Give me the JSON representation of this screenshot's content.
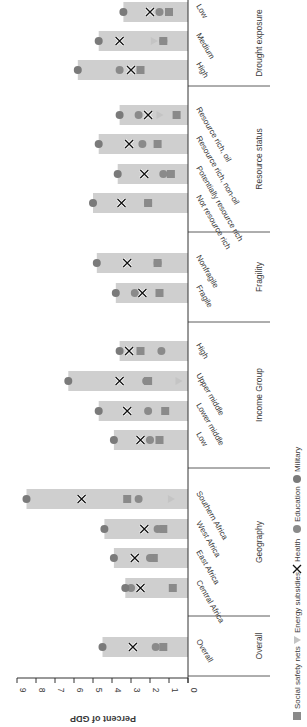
{
  "chart_data": {
    "type": "bar",
    "orientation": "rotated-90-clockwise (horizontal bars in screen space)",
    "title": "",
    "xlabel": "",
    "ylabel": "Percent of GDP",
    "ylim": [
      0,
      9
    ],
    "yticks": [
      0,
      1,
      2,
      3,
      4,
      5,
      6,
      7,
      8,
      9
    ],
    "grid": false,
    "legend_position": "bottom",
    "bar_series": "Military (bar length)",
    "legend": [
      {
        "name": "Social safety nets",
        "marker": "square",
        "color": "#8c8c8c"
      },
      {
        "name": "Energy subsidies",
        "marker": "triangle",
        "color": "#c8c8c8"
      },
      {
        "name": "Health",
        "marker": "x",
        "color": "#000000"
      },
      {
        "name": "Education",
        "marker": "circle",
        "color": "#8c8c8c"
      },
      {
        "name": "Military",
        "marker": "circle",
        "color": "#7a7a7a"
      }
    ],
    "groups": [
      {
        "name": "Overall",
        "categories": [
          {
            "label": "Overall",
            "military": 4.5,
            "health": 2.9,
            "education": 1.7,
            "social_safety_nets": 1.3,
            "energy_subsidies": null
          }
        ]
      },
      {
        "name": "Geography",
        "categories": [
          {
            "label": "Central Africa",
            "military": 3.3,
            "health": 2.5,
            "education": 3.0,
            "social_safety_nets": 0.8,
            "energy_subsidies": null
          },
          {
            "label": "East Africa",
            "military": 3.9,
            "health": 2.8,
            "education": 2.0,
            "social_safety_nets": 1.8,
            "energy_subsidies": null
          },
          {
            "label": "West Africa",
            "military": 4.4,
            "health": 2.3,
            "education": 1.6,
            "social_safety_nets": 1.3,
            "energy_subsidies": null
          },
          {
            "label": "Southern Africa",
            "military": 8.5,
            "health": 5.6,
            "education": 2.6,
            "social_safety_nets": 3.2,
            "energy_subsidies": 0.9
          }
        ]
      },
      {
        "name": "Income Group",
        "categories": [
          {
            "label": "Low",
            "military": 3.9,
            "health": 2.5,
            "education": 2.0,
            "social_safety_nets": 1.5,
            "energy_subsidies": null
          },
          {
            "label": "Lower middle",
            "military": 4.7,
            "health": 3.2,
            "education": 2.1,
            "social_safety_nets": 1.2,
            "energy_subsidies": null
          },
          {
            "label": "Upper middle",
            "military": 6.3,
            "health": 3.6,
            "education": 2.2,
            "social_safety_nets": 2.1,
            "energy_subsidies": 0.5
          },
          {
            "label": "High",
            "military": 3.6,
            "health": 3.1,
            "education": 1.4,
            "social_safety_nets": 2.5,
            "energy_subsidies": null
          }
        ]
      },
      {
        "name": "Fragility",
        "categories": [
          {
            "label": "Fragile",
            "military": 3.8,
            "health": 2.4,
            "education": 2.8,
            "social_safety_nets": 1.5,
            "energy_subsidies": null
          },
          {
            "label": "Nonfragile",
            "military": 4.8,
            "health": 3.2,
            "education": 1.6,
            "social_safety_nets": 1.6,
            "energy_subsidies": null
          }
        ]
      },
      {
        "name": "Resource status",
        "categories": [
          {
            "label": "Not resource rich",
            "military": 5.0,
            "health": 3.5,
            "education": 2.1,
            "social_safety_nets": 2.1,
            "energy_subsidies": null
          },
          {
            "label": "Potentially resource rich",
            "military": 3.7,
            "health": 2.3,
            "education": 1.3,
            "social_safety_nets": 0.9,
            "energy_subsidies": null
          },
          {
            "label": "Resource rich, non-oil",
            "military": 4.7,
            "health": 3.1,
            "education": 2.4,
            "social_safety_nets": 1.6,
            "energy_subsidies": null
          },
          {
            "label": "Resource rich, oil",
            "military": 3.6,
            "health": 2.1,
            "education": 2.6,
            "social_safety_nets": 0.6,
            "energy_subsidies": 1.5
          }
        ]
      },
      {
        "name": "Drought exposure",
        "categories": [
          {
            "label": "High",
            "military": 5.8,
            "health": 3.0,
            "education": 3.6,
            "social_safety_nets": 2.5,
            "energy_subsidies": null
          },
          {
            "label": "Medium",
            "military": 4.7,
            "health": 3.6,
            "education": 1.3,
            "social_safety_nets": 1.3,
            "energy_subsidies": 1.8
          },
          {
            "label": "Low",
            "military": 3.4,
            "health": 2.0,
            "education": 1.5,
            "social_safety_nets": 1.0,
            "energy_subsidies": null
          }
        ]
      }
    ]
  },
  "colors": {
    "bar": "#cfcfcf",
    "marker_gray": "#8a8a8a",
    "marker_dark": "#7a7a7a",
    "energy": "#c4c4c4",
    "axis": "#333333",
    "text": "#3a3a3a"
  },
  "axis": {
    "title": "Percent of GDP"
  },
  "legend_labels": {
    "social_safety_nets": "Social safety nets",
    "energy_subsidies": "Energy subsidies",
    "health": "Health",
    "education": "Education",
    "military": "Military"
  }
}
